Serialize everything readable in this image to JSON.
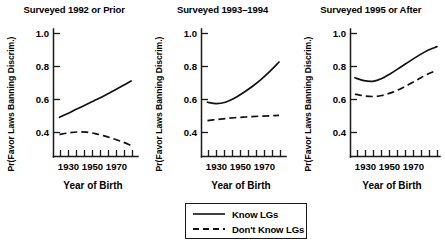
{
  "chart_data": {
    "type": "line",
    "title": "",
    "xlabel": "Year of Birth",
    "ylabel": "Pr(Favor Laws Banning Discrim.)",
    "xlim": [
      1920,
      1980
    ],
    "ylim": [
      0.28,
      1.06
    ],
    "grid": false,
    "legend_position": "bottom-center",
    "x_ticks_major": [
      1930,
      1950,
      1970
    ],
    "x_ticks_all": [
      1925,
      1930,
      1935,
      1940,
      1945,
      1950,
      1955,
      1960,
      1965,
      1970,
      1975
    ],
    "x_tick_labels": [
      "1930",
      "1950",
      "1970"
    ],
    "y_ticks": [
      0.4,
      0.6,
      0.8,
      1.0
    ],
    "y_tick_labels": [
      "0.4",
      "0.6",
      "0.8",
      "1.0"
    ],
    "legend": [
      {
        "name": "Know LGs",
        "style": "solid"
      },
      {
        "name": "Don't Know LGs",
        "style": "dashed"
      }
    ],
    "panels": [
      {
        "title": "Surveyed 1992 or Prior",
        "xlabel": "Year of Birth",
        "ylabel": "Pr(Favor Laws Banning Discrim.)",
        "series": [
          {
            "name": "Know LGs",
            "style": "solid",
            "x": [
              1924,
              1930,
              1936,
              1942,
              1948,
              1954,
              1960,
              1966,
              1972
            ],
            "values": [
              0.52,
              0.545,
              0.572,
              0.598,
              0.625,
              0.652,
              0.681,
              0.711,
              0.742
            ]
          },
          {
            "name": "Don't Know LGs",
            "style": "dashed",
            "x": [
              1924,
              1930,
              1936,
              1942,
              1948,
              1954,
              1960,
              1966,
              1972
            ],
            "values": [
              0.415,
              0.424,
              0.43,
              0.429,
              0.42,
              0.406,
              0.389,
              0.37,
              0.348
            ]
          }
        ]
      },
      {
        "title": "Surveyed 1993–1994",
        "xlabel": "Year of Birth",
        "ylabel": "Pr(Favor Laws Banning Discrim.)",
        "series": [
          {
            "name": "Know LGs",
            "style": "solid",
            "x": [
              1924,
              1930,
              1936,
              1942,
              1948,
              1954,
              1960,
              1966,
              1972
            ],
            "values": [
              0.612,
              0.604,
              0.612,
              0.636,
              0.67,
              0.708,
              0.752,
              0.802,
              0.858
            ]
          },
          {
            "name": "Don't Know LGs",
            "style": "dashed",
            "x": [
              1924,
              1930,
              1936,
              1942,
              1948,
              1954,
              1960,
              1966,
              1972
            ],
            "values": [
              0.5,
              0.506,
              0.512,
              0.517,
              0.521,
              0.524,
              0.527,
              0.529,
              0.531
            ]
          }
        ]
      },
      {
        "title": "Surveyed 1995 or After",
        "xlabel": "Year of Birth",
        "ylabel": "Pr(Favor Laws Banning Discrim.)",
        "series": [
          {
            "name": "Know LGs",
            "style": "solid",
            "x": [
              1923,
              1929,
              1935,
              1941,
              1947,
              1953,
              1959,
              1965,
              1971,
              1978
            ],
            "values": [
              0.762,
              0.744,
              0.74,
              0.757,
              0.788,
              0.823,
              0.859,
              0.894,
              0.926,
              0.952
            ]
          },
          {
            "name": "Don't Know LGs",
            "style": "dashed",
            "x": [
              1923,
              1929,
              1935,
              1941,
              1947,
              1953,
              1959,
              1965,
              1971,
              1978
            ],
            "values": [
              0.662,
              0.651,
              0.647,
              0.653,
              0.669,
              0.692,
              0.72,
              0.75,
              0.781,
              0.808
            ]
          }
        ]
      }
    ]
  },
  "colors": {
    "line": "#111111",
    "axis": "#1a1a1a",
    "background": "#ffffff"
  }
}
